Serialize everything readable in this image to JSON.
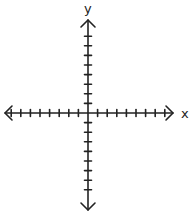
{
  "diagram": {
    "type": "coordinate-plane",
    "x_axis": {
      "label": "x",
      "ticks_negative": 8,
      "ticks_positive": 8,
      "arrows": [
        "left",
        "right"
      ]
    },
    "y_axis": {
      "label": "y",
      "ticks_negative": 8,
      "ticks_positive": 8,
      "arrows": [
        "up",
        "down"
      ]
    },
    "stroke_color": "#222222",
    "background": "#ffffff"
  }
}
